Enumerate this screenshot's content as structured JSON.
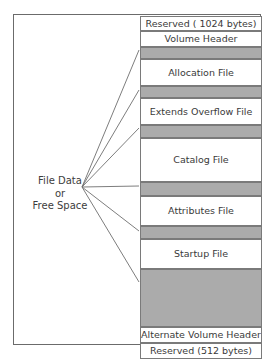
{
  "figure": {
    "colors": {
      "frame_border": "#6b6b6b",
      "block_border": "#7a7a7a",
      "free_space_fill": "#ababab",
      "block_fill": "#ffffff",
      "text": "#3a3a3a",
      "leader_line": "#6e6e6e",
      "background": "#ffffff"
    }
  },
  "left_annotation": {
    "name": "file-data-or-free-space",
    "lines": [
      "File Data",
      "or",
      "Free Space"
    ],
    "line1": "File Data",
    "line2": "or",
    "line3": "Free Space",
    "anchor": {
      "x": 82,
      "y": 187
    }
  },
  "volume_column": {
    "x": 140,
    "y": 16,
    "width": 122,
    "height": 328,
    "blocks": [
      {
        "label": "Reserved ( 1024 bytes)",
        "kind": "reserved",
        "fill": "white",
        "top": 0,
        "height": 15
      },
      {
        "label": "Volume Header",
        "kind": "volume-header",
        "fill": "white",
        "top": 15,
        "height": 16
      },
      {
        "label": "",
        "kind": "free-space",
        "fill": "gray",
        "top": 31,
        "height": 12
      },
      {
        "label": "Allocation File",
        "kind": "allocation-file",
        "fill": "white",
        "top": 43,
        "height": 27
      },
      {
        "label": "",
        "kind": "free-space",
        "fill": "gray",
        "top": 70,
        "height": 12
      },
      {
        "label": "Extends Overflow File",
        "kind": "extents-overflow-file",
        "fill": "white",
        "top": 82,
        "height": 27
      },
      {
        "label": "",
        "kind": "free-space",
        "fill": "gray",
        "top": 109,
        "height": 13
      },
      {
        "label": "Catalog File",
        "kind": "catalog-file",
        "fill": "white",
        "top": 122,
        "height": 44
      },
      {
        "label": "",
        "kind": "free-space",
        "fill": "gray",
        "top": 166,
        "height": 14
      },
      {
        "label": "Attributes File",
        "kind": "attributes-file",
        "fill": "white",
        "top": 180,
        "height": 30
      },
      {
        "label": "",
        "kind": "free-space",
        "fill": "gray",
        "top": 210,
        "height": 13
      },
      {
        "label": "Startup File",
        "kind": "startup-file",
        "fill": "white",
        "top": 223,
        "height": 30
      },
      {
        "label": "",
        "kind": "free-space",
        "fill": "gray",
        "top": 253,
        "height": 58
      },
      {
        "label": "Alternate Volume Header",
        "kind": "alternate-volume-header",
        "fill": "white",
        "top": 311,
        "height": 16
      },
      {
        "label": "Reserved (512 bytes)",
        "kind": "reserved",
        "fill": "white",
        "top": 327,
        "height": 16
      }
    ]
  },
  "leader_lines": {
    "stroke": "#6e6e6e",
    "stroke_width": 0.9,
    "from": {
      "x": 82,
      "y": 187
    },
    "to": [
      {
        "x": 139,
        "y": 50
      },
      {
        "x": 139,
        "y": 90
      },
      {
        "x": 139,
        "y": 128
      },
      {
        "x": 139,
        "y": 186
      },
      {
        "x": 139,
        "y": 231
      },
      {
        "x": 139,
        "y": 282
      }
    ]
  }
}
